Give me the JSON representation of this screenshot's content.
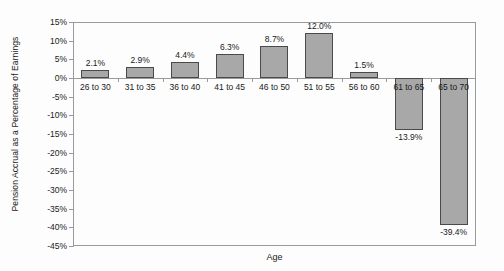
{
  "chart_data": {
    "type": "bar",
    "title": "",
    "xlabel": "Age",
    "ylabel": "Pension Accrual as a Percentage of Earnings",
    "categories": [
      "26 to 30",
      "31 to 35",
      "36 to 40",
      "41 to 45",
      "46 to 50",
      "51 to 55",
      "56 to 60",
      "61 to 65",
      "65 to 70"
    ],
    "values": [
      2.1,
      2.9,
      4.4,
      6.3,
      8.7,
      12.0,
      1.5,
      -13.9,
      -39.4
    ],
    "data_labels": [
      "2.1%",
      "2.9%",
      "4.4%",
      "6.3%",
      "8.7%",
      "12.0%",
      "1.5%",
      "-13.9%",
      "-39.4%"
    ],
    "ylim": [
      -45,
      15
    ],
    "ytick_values": [
      15,
      10,
      5,
      0,
      -5,
      -10,
      -15,
      -20,
      -25,
      -30,
      -35,
      -40,
      -45
    ],
    "ytick_labels": [
      "15%",
      "10%",
      "5%",
      "0%",
      "-5%",
      "-10%",
      "-15%",
      "-20%",
      "-25%",
      "-30%",
      "-35%",
      "-40%",
      "-45%"
    ],
    "grid": false,
    "legend": false,
    "bar_fill_color": "#a8a8a8",
    "bar_border_color": "#4a4a4a",
    "axis_color": "#9a9a9a",
    "text_color": "#1a1a1a",
    "background_color": "#fdfdfd"
  }
}
